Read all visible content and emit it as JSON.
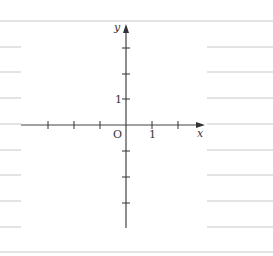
{
  "diagram": {
    "type": "coordinate-plane",
    "axes": {
      "x_label": "x",
      "y_label": "y",
      "origin_label": "O",
      "x_unit_label": "1",
      "y_unit_label": "1",
      "x_ticks": [
        -3,
        -2,
        -1,
        1,
        2
      ],
      "y_ticks": [
        -4,
        -3,
        -2,
        -1,
        1,
        2,
        3
      ]
    },
    "ruled_lines": {
      "count_left": 8,
      "count_right": 8,
      "top_border": true,
      "bottom_border": true
    }
  },
  "colors": {
    "axis": "#444444",
    "ruled_line": "#c8c8c8",
    "background": "#ffffff"
  }
}
